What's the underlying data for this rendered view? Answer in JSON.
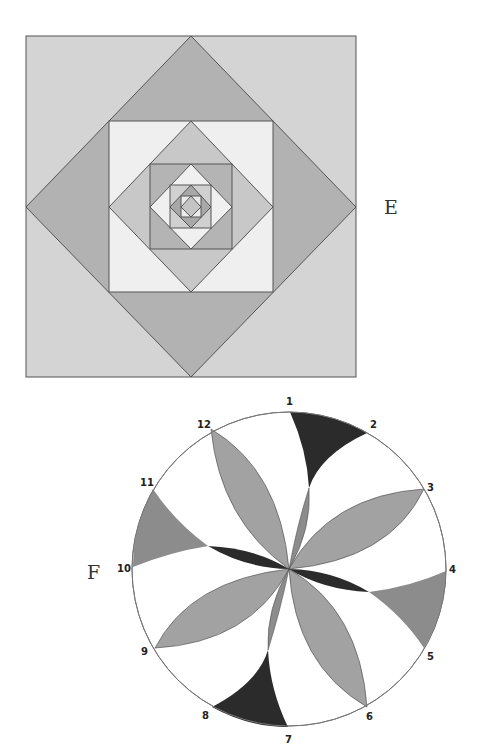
{
  "figures": {
    "e": {
      "label": "E",
      "description": "Nested alternating squares and diamonds",
      "center": [
        191,
        207
      ],
      "outer_half": 165,
      "levels": 5,
      "colors": {
        "stroke": "#555555",
        "square_corners": [
          "#d4d4d4",
          "#efefef",
          "#b4b4b4",
          "#d0d0d0",
          "#eaeaea"
        ],
        "diamond_triangles": [
          "#b2b2b2",
          "#c8c8c8",
          "#f0f0f0",
          "#a8a8a8"
        ],
        "innermost": "#c4c4c4"
      }
    },
    "f": {
      "label": "F",
      "description": "Circle divided into 12 points with lens petals and curved wedges",
      "center": [
        289,
        569
      ],
      "radius": 157,
      "points": [
        "1",
        "2",
        "3",
        "4",
        "5",
        "6",
        "7",
        "8",
        "9",
        "10",
        "11",
        "12"
      ],
      "colors": {
        "circle_stroke": "#777777",
        "petal": "#a2a2a2",
        "dark": "#2b2b2b",
        "wedge_medium": "#8c8c8c"
      }
    }
  }
}
